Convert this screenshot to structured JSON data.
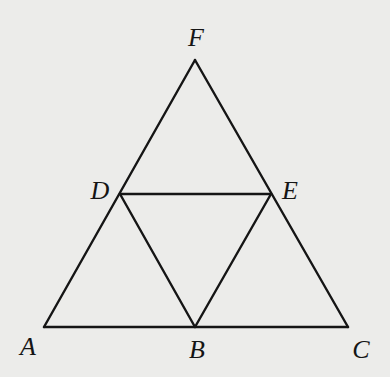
{
  "diagram": {
    "type": "geometry",
    "points": {
      "A": {
        "label": "A",
        "x": 44,
        "y": 327,
        "lx": 28,
        "ly": 355
      },
      "B": {
        "label": "B",
        "x": 195,
        "y": 327,
        "lx": 197,
        "ly": 358
      },
      "C": {
        "label": "C",
        "x": 348,
        "y": 327,
        "lx": 361,
        "ly": 358
      },
      "D": {
        "label": "D",
        "x": 120,
        "y": 194,
        "lx": 100,
        "ly": 199
      },
      "E": {
        "label": "E",
        "x": 271,
        "y": 194,
        "lx": 290,
        "ly": 199
      },
      "F": {
        "label": "F",
        "x": 195,
        "y": 60,
        "lx": 196,
        "ly": 46
      }
    },
    "segments": [
      [
        "A",
        "C"
      ],
      [
        "A",
        "F"
      ],
      [
        "F",
        "C"
      ],
      [
        "D",
        "E"
      ],
      [
        "D",
        "B"
      ],
      [
        "E",
        "B"
      ]
    ],
    "colors": {
      "background": "#ececea",
      "stroke": "#151515"
    }
  }
}
